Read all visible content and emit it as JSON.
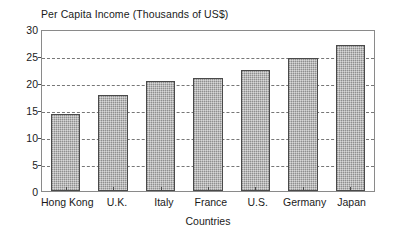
{
  "chart_data": {
    "type": "bar",
    "title": "Per Capita Income (Thousands of US$)",
    "xlabel": "Countries",
    "ylabel": "",
    "categories": [
      "Hong Kong",
      "U.K.",
      "Italy",
      "France",
      "U.S.",
      "Germany",
      "Japan"
    ],
    "values": [
      14.2,
      17.8,
      20.3,
      21.0,
      22.4,
      24.6,
      27.0
    ],
    "ylim": [
      0,
      30
    ],
    "yticks": [
      0,
      5,
      10,
      15,
      20,
      25,
      30
    ],
    "ytick_labels": [
      "0",
      "5",
      "10",
      "15",
      "20",
      "25",
      "30"
    ],
    "grid": true,
    "grid_style": "dashed-horizontal",
    "legend": null,
    "bar_fill_color": "#b9b9b9",
    "bar_edge_color": "#4a4a4a",
    "frame_color": "#8a8a8a",
    "background_color": "#ffffff"
  }
}
